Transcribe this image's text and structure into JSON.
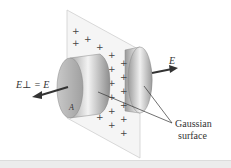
{
  "figure": {
    "labels": {
      "e_perp_left": "E⊥ = E",
      "e_right": "E",
      "area": "A",
      "gaussian_line1": "Gaussian",
      "gaussian_line2": "surface"
    },
    "charge_symbol": "+",
    "colors": {
      "sheet": "#f4f4f4",
      "sheet_edge": "#c8c8c8",
      "cylinder_light": "#f2f2f2",
      "cylinder_dark": "#9a9a9a",
      "arrow": "#3a3a3a",
      "charge": "#444444",
      "bottom_band": "#ececec"
    }
  }
}
